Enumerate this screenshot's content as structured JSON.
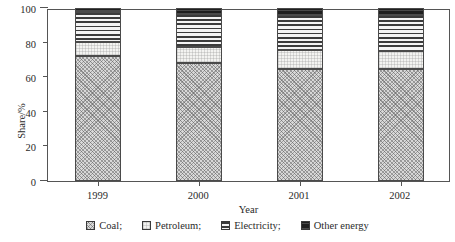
{
  "chart_data": {
    "type": "bar",
    "stacked": true,
    "stack_total": 100,
    "title": "",
    "xlabel": "Year",
    "ylabel": "Share/%",
    "categories": [
      "1999",
      "2000",
      "2001",
      "2002"
    ],
    "ylim": [
      0,
      100
    ],
    "yticks": [
      0,
      20,
      40,
      60,
      80,
      100
    ],
    "ytick_labels": [
      "0",
      "20",
      "40",
      "60",
      "80",
      "100"
    ],
    "grid": false,
    "legend_position": "bottom",
    "series": [
      {
        "name": "Coal;",
        "legend_label": "Coal;",
        "pattern": "cross-hatch",
        "color": "#d8d8d8",
        "values": [
          72.5,
          68.0,
          65.0,
          65.0
        ]
      },
      {
        "name": "Petroleum;",
        "legend_label": "Petroleum;",
        "pattern": "fine-dotted",
        "color": "#f3f3f1",
        "values": [
          8.0,
          9.5,
          10.5,
          10.0
        ]
      },
      {
        "name": "Electricity;",
        "legend_label": "Electricity;",
        "pattern": "horizontal-lines",
        "color": "#efefef",
        "values": [
          17.0,
          19.0,
          20.5,
          21.0
        ]
      },
      {
        "name": "Other energy",
        "legend_label": "Other energy",
        "pattern": "solid-dark",
        "color": "#2a2a2a",
        "values": [
          2.5,
          3.5,
          4.0,
          4.0
        ]
      }
    ]
  },
  "axes": {
    "y_title": "Share/%",
    "x_title": "Year"
  },
  "colors": {
    "axis": "#555555",
    "text": "#2a2a2a",
    "background": "#ffffff"
  }
}
